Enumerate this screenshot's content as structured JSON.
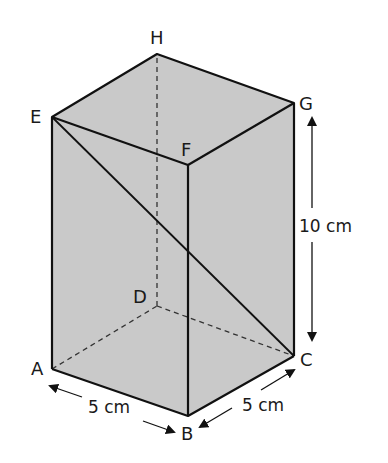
{
  "figure": {
    "type": "cuboid",
    "fill_color": "#c9c9c9",
    "line_color": "#111111",
    "vertices": {
      "A": {
        "label": "A",
        "x": 52,
        "y": 369
      },
      "B": {
        "label": "B",
        "x": 188,
        "y": 416
      },
      "C": {
        "label": "C",
        "x": 294,
        "y": 356
      },
      "D": {
        "label": "D",
        "x": 157,
        "y": 306
      },
      "E": {
        "label": "E",
        "x": 52,
        "y": 117
      },
      "F": {
        "label": "F",
        "x": 188,
        "y": 165
      },
      "G": {
        "label": "G",
        "x": 294,
        "y": 103
      },
      "H": {
        "label": "H",
        "x": 157,
        "y": 54
      }
    },
    "hidden_edges": [
      "AD",
      "DC",
      "DH"
    ],
    "diagonal": "EC",
    "dimensions": {
      "ab": "5 cm",
      "bc": "5 cm",
      "height": "10 cm"
    }
  }
}
